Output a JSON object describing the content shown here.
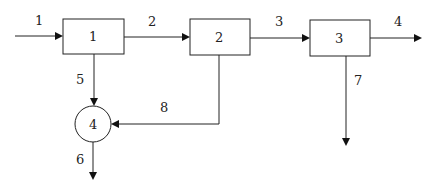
{
  "diagram": {
    "type": "process-flow",
    "nodes": [
      {
        "id": "1",
        "label": "1",
        "shape": "rectangle"
      },
      {
        "id": "2",
        "label": "2",
        "shape": "rectangle"
      },
      {
        "id": "3",
        "label": "3",
        "shape": "rectangle"
      },
      {
        "id": "4",
        "label": "4",
        "shape": "circle"
      }
    ],
    "streams": [
      {
        "label": "1",
        "from": "input",
        "to": "1"
      },
      {
        "label": "2",
        "from": "1",
        "to": "2"
      },
      {
        "label": "3",
        "from": "2",
        "to": "3"
      },
      {
        "label": "4",
        "from": "3",
        "to": "output"
      },
      {
        "label": "5",
        "from": "1",
        "to": "4"
      },
      {
        "label": "6",
        "from": "4",
        "to": "output"
      },
      {
        "label": "7",
        "from": "3",
        "to": "output"
      },
      {
        "label": "8",
        "from": "2",
        "to": "4"
      }
    ],
    "colors": {
      "line": "#222222",
      "background": "#ffffff"
    }
  }
}
